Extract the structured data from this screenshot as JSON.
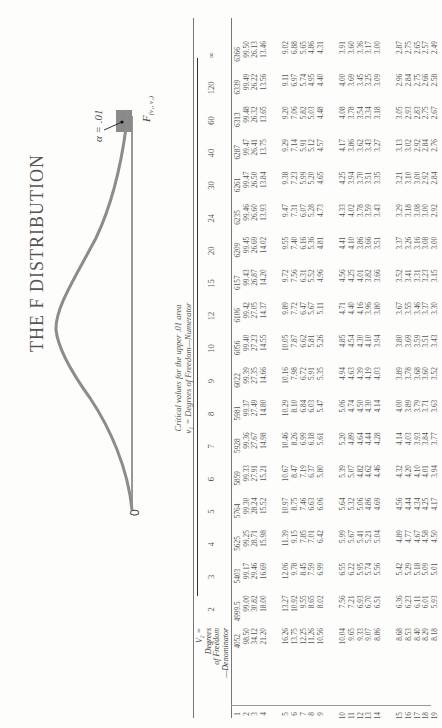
{
  "page": {
    "title": "THE F DISTRIBUTION",
    "figure": {
      "origin_label": "0",
      "alpha_label": "α = .01",
      "critical_label": "F",
      "critical_subscript": "(ν₁, ν₂)"
    },
    "caption": {
      "line1": "Critical values for the upper .01 area",
      "line2": "ν₁ = Degrees of Freedom—Numerator"
    },
    "row_header": [
      "V₂ =",
      "Degrees",
      "of Freedom",
      "—Denominator"
    ]
  },
  "chart_data": {
    "type": "table",
    "alpha": 0.01,
    "column_header": "ν₁ = Degrees of Freedom—Numerator",
    "row_header": "ν₂ = Degrees of Freedom—Denominator",
    "columns": [
      "1",
      "2",
      "3",
      "4",
      "5",
      "6",
      "7",
      "8",
      "9",
      "10",
      "12",
      "15",
      "20",
      "24",
      "30",
      "40",
      "60",
      "120",
      "∞"
    ],
    "rows": [
      {
        "df": "1",
        "values": [
          "4052",
          "4999.5",
          "5403",
          "5625",
          "5764",
          "5859",
          "5928",
          "5981",
          "6022",
          "6056",
          "6106",
          "6157",
          "6209",
          "6235",
          "6261",
          "6287",
          "6313",
          "6339",
          "6366"
        ]
      },
      {
        "df": "2",
        "values": [
          "98.50",
          "99.00",
          "99.17",
          "99.25",
          "99.30",
          "99.33",
          "99.36",
          "99.37",
          "99.39",
          "99.40",
          "99.42",
          "99.43",
          "99.45",
          "99.46",
          "99.47",
          "99.47",
          "99.48",
          "99.49",
          "99.50"
        ]
      },
      {
        "df": "3",
        "values": [
          "34.12",
          "30.82",
          "29.46",
          "28.71",
          "28.24",
          "27.91",
          "27.67",
          "27.49",
          "27.35",
          "27.23",
          "27.05",
          "26.87",
          "26.69",
          "26.60",
          "26.50",
          "26.41",
          "26.32",
          "26.22",
          "26.13"
        ]
      },
      {
        "df": "4",
        "values": [
          "21.20",
          "18.00",
          "16.69",
          "15.98",
          "15.52",
          "15.21",
          "14.98",
          "14.80",
          "14.66",
          "14.55",
          "14.37",
          "14.20",
          "14.02",
          "13.93",
          "13.84",
          "13.75",
          "13.65",
          "13.56",
          "13.46"
        ]
      },
      {
        "df": "5",
        "values": [
          "16.26",
          "13.27",
          "12.06",
          "11.39",
          "10.97",
          "10.67",
          "10.46",
          "10.29",
          "10.16",
          "10.05",
          "9.89",
          "9.72",
          "9.55",
          "9.47",
          "9.38",
          "9.29",
          "9.20",
          "9.11",
          "9.02"
        ]
      },
      {
        "df": "6",
        "values": [
          "13.75",
          "10.92",
          "9.78",
          "9.15",
          "8.75",
          "8.47",
          "8.26",
          "8.10",
          "7.98",
          "7.87",
          "7.72",
          "7.56",
          "7.40",
          "7.31",
          "7.23",
          "7.14",
          "7.06",
          "6.97",
          "6.88"
        ]
      },
      {
        "df": "7",
        "values": [
          "12.25",
          "9.55",
          "8.45",
          "7.85",
          "7.46",
          "7.19",
          "6.99",
          "6.84",
          "6.72",
          "6.62",
          "6.47",
          "6.31",
          "6.16",
          "6.07",
          "5.99",
          "5.91",
          "5.82",
          "5.74",
          "5.65"
        ]
      },
      {
        "df": "8",
        "values": [
          "11.26",
          "8.65",
          "7.59",
          "7.01",
          "6.63",
          "6.37",
          "6.18",
          "6.03",
          "5.91",
          "5.81",
          "5.67",
          "5.52",
          "5.36",
          "5.28",
          "5.20",
          "5.12",
          "5.03",
          "4.95",
          "4.86"
        ]
      },
      {
        "df": "9",
        "values": [
          "10.56",
          "8.02",
          "6.99",
          "6.42",
          "6.06",
          "5.80",
          "5.61",
          "5.47",
          "5.35",
          "5.26",
          "5.11",
          "4.96",
          "4.81",
          "4.73",
          "4.65",
          "4.57",
          "4.48",
          "4.40",
          "4.31"
        ]
      },
      {
        "df": "10",
        "values": [
          "10.04",
          "7.56",
          "6.55",
          "5.99",
          "5.64",
          "5.39",
          "5.20",
          "5.06",
          "4.94",
          "4.85",
          "4.71",
          "4.56",
          "4.41",
          "4.33",
          "4.25",
          "4.17",
          "4.08",
          "4.00",
          "3.91"
        ]
      },
      {
        "df": "11",
        "values": [
          "9.65",
          "7.21",
          "6.22",
          "5.67",
          "5.32",
          "5.07",
          "4.89",
          "4.74",
          "4.63",
          "4.54",
          "4.40",
          "4.25",
          "4.10",
          "4.02",
          "3.94",
          "3.86",
          "3.78",
          "3.69",
          "3.60"
        ]
      },
      {
        "df": "12",
        "values": [
          "9.33",
          "6.93",
          "5.95",
          "5.41",
          "5.06",
          "4.82",
          "4.64",
          "4.50",
          "4.39",
          "4.30",
          "4.16",
          "4.01",
          "3.86",
          "3.78",
          "3.70",
          "3.62",
          "3.54",
          "3.45",
          "3.36"
        ]
      },
      {
        "df": "13",
        "values": [
          "9.07",
          "6.70",
          "5.74",
          "5.21",
          "4.86",
          "4.62",
          "4.44",
          "4.30",
          "4.19",
          "4.10",
          "3.96",
          "3.82",
          "3.66",
          "3.59",
          "3.51",
          "3.43",
          "3.34",
          "3.25",
          "3.17"
        ]
      },
      {
        "df": "14",
        "values": [
          "8.86",
          "6.51",
          "5.56",
          "5.04",
          "4.69",
          "4.46",
          "4.28",
          "4.14",
          "4.03",
          "3.94",
          "3.80",
          "3.66",
          "3.51",
          "3.43",
          "3.35",
          "3.27",
          "3.18",
          "3.09",
          "3.00"
        ]
      },
      {
        "df": "15",
        "values": [
          "8.68",
          "6.36",
          "5.42",
          "4.89",
          "4.56",
          "4.32",
          "4.14",
          "4.00",
          "3.89",
          "3.80",
          "3.67",
          "3.52",
          "3.37",
          "3.29",
          "3.21",
          "3.13",
          "3.05",
          "2.96",
          "2.87"
        ]
      },
      {
        "df": "16",
        "values": [
          "8.53",
          "6.23",
          "5.29",
          "4.77",
          "4.44",
          "4.20",
          "4.03",
          "3.89",
          "3.78",
          "3.69",
          "3.55",
          "3.41",
          "3.26",
          "3.18",
          "3.10",
          "3.02",
          "2.93",
          "2.84",
          "2.75"
        ]
      },
      {
        "df": "17",
        "values": [
          "8.40",
          "6.11",
          "5.18",
          "4.67",
          "4.34",
          "4.10",
          "3.93",
          "3.79",
          "3.68",
          "3.59",
          "3.46",
          "3.31",
          "3.16",
          "3.08",
          "3.00",
          "2.92",
          "2.83",
          "2.75",
          "2.65"
        ]
      },
      {
        "df": "18",
        "values": [
          "8.29",
          "6.01",
          "5.09",
          "4.58",
          "4.25",
          "4.01",
          "3.84",
          "3.71",
          "3.60",
          "3.51",
          "3.37",
          "3.23",
          "3.08",
          "3.00",
          "2.92",
          "2.84",
          "2.75",
          "2.66",
          "2.57"
        ]
      },
      {
        "df": "19",
        "values": [
          "8.18",
          "5.93",
          "5.01",
          "4.50",
          "4.17",
          "3.94",
          "3.77",
          "3.63",
          "3.52",
          "3.43",
          "3.30",
          "3.15",
          "3.00",
          "2.92",
          "2.84",
          "2.76",
          "2.67",
          "2.58",
          "2.49"
        ]
      }
    ],
    "layout": {
      "orientation": "rotated-90-ccw",
      "row_groups": [
        [
          1,
          4
        ],
        [
          5,
          9
        ],
        [
          10,
          14
        ],
        [
          15,
          19
        ]
      ]
    }
  }
}
